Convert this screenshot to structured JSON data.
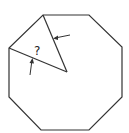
{
  "diagram": {
    "shape": "regular octagon",
    "question_label": "?",
    "stroke_color": "#333333",
    "vertices": [
      [
        43,
        15
      ],
      [
        89,
        15
      ],
      [
        122,
        47
      ],
      [
        122,
        97
      ],
      [
        89,
        130
      ],
      [
        41,
        130
      ],
      [
        9,
        97
      ],
      [
        9,
        48
      ]
    ],
    "center": [
      67,
      72
    ],
    "radii_from_vertices": [
      [
        43,
        15
      ],
      [
        9,
        48
      ]
    ],
    "arrows": [
      {
        "note": "arrow pointing to upper radius from right"
      },
      {
        "note": "arrow pointing to lower radius from below"
      }
    ]
  }
}
